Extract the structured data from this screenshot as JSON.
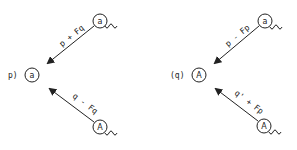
{
  "diagram": {
    "left": {
      "target_prefix": "p)",
      "target_circle": "a",
      "top_source_circle": "a",
      "top_arrow_label": "p + Fq",
      "bottom_source_circle": "A",
      "bottom_arrow_label": "q - Fq"
    },
    "right": {
      "target_prefix": "(q)",
      "target_circle": "A",
      "top_source_circle": "a",
      "top_arrow_label": "p - Fp",
      "bottom_source_circle": "A",
      "bottom_arrow_label": "q' + Fp"
    },
    "colors": {
      "ink": "#222222",
      "background": "#ffffff"
    }
  }
}
